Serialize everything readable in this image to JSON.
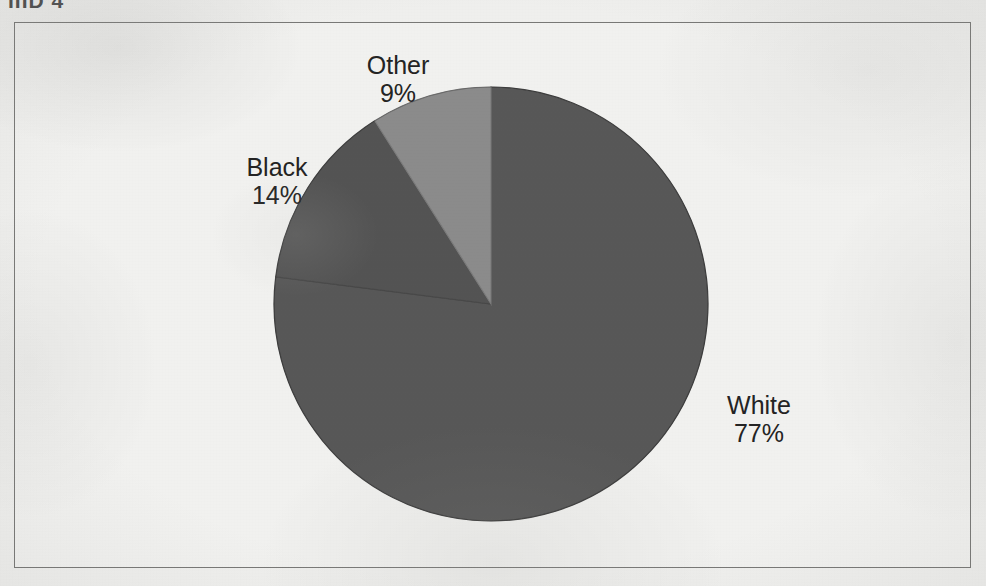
{
  "document": {
    "top_clipped_text": "IIID 4",
    "frame_color": "#7a7a78",
    "background_color": "#f2f2f0"
  },
  "chart_data": {
    "type": "pie",
    "title": "",
    "subtitle": "",
    "xlabel": "",
    "ylabel": "",
    "legend_position": "none",
    "grid": false,
    "label_format": "category-newline-percent",
    "start_angle_deg": 0,
    "direction": "clockwise",
    "categories": [
      "White",
      "Black",
      "Other"
    ],
    "values": [
      77,
      14,
      9
    ],
    "unit": "%",
    "colors": [
      "#595959",
      "#555555",
      "#8d8d8d"
    ],
    "slices": [
      {
        "label": "White",
        "value": 77,
        "display_value": "77%",
        "color": "#595959",
        "start_deg": 0,
        "end_deg": 277.2
      },
      {
        "label": "Black",
        "value": 14,
        "display_value": "14%",
        "color": "#555555",
        "start_deg": 277.2,
        "end_deg": 327.6
      },
      {
        "label": "Other",
        "value": 9,
        "display_value": "9%",
        "color": "#8d8d8d",
        "start_deg": 327.6,
        "end_deg": 360
      }
    ]
  }
}
